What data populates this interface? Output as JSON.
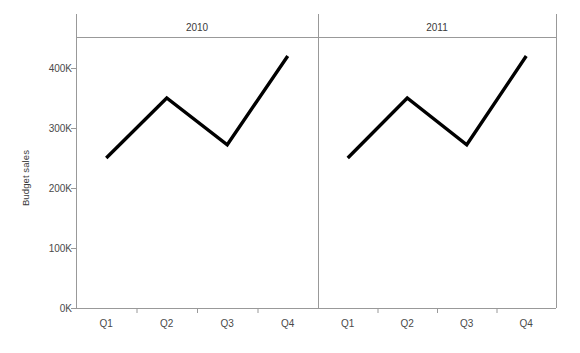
{
  "chart_data": {
    "type": "line",
    "title": "",
    "subtitle": "",
    "xlabel": "",
    "ylabel": "Budget sales",
    "categories": [
      "Q1",
      "Q2",
      "Q3",
      "Q4"
    ],
    "ylim": [
      0,
      450000
    ],
    "yticks": [
      0,
      100000,
      200000,
      300000,
      400000
    ],
    "ytick_labels": [
      "0K",
      "100K",
      "200K",
      "300K",
      "400K"
    ],
    "grid": false,
    "legend": "none",
    "facet_by": "year",
    "panels": [
      {
        "label": "2010",
        "series": [
          {
            "name": "Budget sales",
            "color": "#000000",
            "values": [
              250000,
              350000,
              272000,
              420000
            ]
          }
        ]
      },
      {
        "label": "2011",
        "series": [
          {
            "name": "Budget sales",
            "color": "#000000",
            "values": [
              250000,
              350000,
              272000,
              420000
            ]
          }
        ]
      }
    ]
  },
  "style": {
    "axis_color": "#999999",
    "line_color": "#000000",
    "text_color": "#3a3a3a",
    "background": "#ffffff"
  }
}
